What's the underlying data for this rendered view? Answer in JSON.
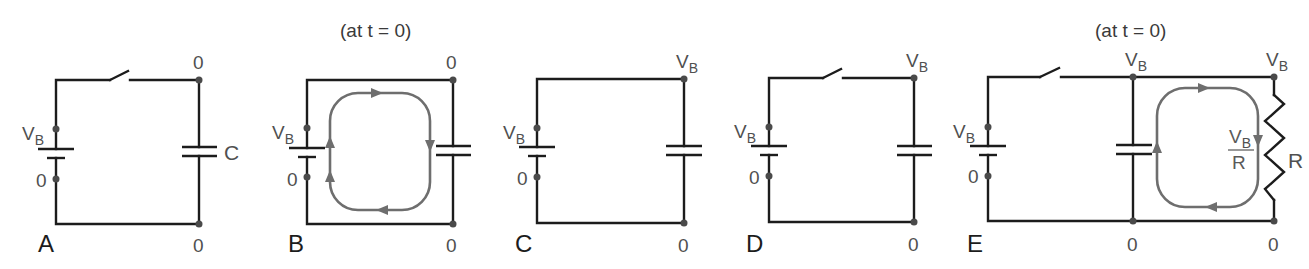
{
  "figure": {
    "colors": {
      "wire": "#1c1c1c",
      "node_dot": "#4a4a4a",
      "label": "#505050",
      "current_loop": "#6e6e6e"
    },
    "panels": [
      {
        "id": "A",
        "label": "A",
        "note": "",
        "switch": "open",
        "battery": {
          "top_label": "V",
          "top_sub": "B",
          "bottom_label": "0"
        },
        "capacitor": {
          "label": "C"
        },
        "nodes": {
          "top_right": "0",
          "top_right_sub": "",
          "bottom_right": "0"
        }
      },
      {
        "id": "B",
        "label": "B",
        "note": "(at t = 0)",
        "switch": "closed",
        "battery": {
          "top_label": "V",
          "top_sub": "B",
          "bottom_label": "0"
        },
        "capacitor": {
          "label": ""
        },
        "nodes": {
          "top_right": "0",
          "top_right_sub": "",
          "bottom_right": "0"
        },
        "current_loop": "clockwise"
      },
      {
        "id": "C",
        "label": "C",
        "note": "",
        "switch": "closed",
        "battery": {
          "top_label": "V",
          "top_sub": "B",
          "bottom_label": "0"
        },
        "capacitor": {
          "label": ""
        },
        "nodes": {
          "top_right": "V",
          "top_right_sub": "B",
          "bottom_right": "0"
        }
      },
      {
        "id": "D",
        "label": "D",
        "note": "",
        "switch": "open",
        "battery": {
          "top_label": "V",
          "top_sub": "B",
          "bottom_label": "0"
        },
        "capacitor": {
          "label": ""
        },
        "nodes": {
          "top_right": "V",
          "top_right_sub": "B",
          "bottom_right": "0"
        }
      },
      {
        "id": "E",
        "label": "E",
        "note": "(at t = 0)",
        "switch": "open",
        "battery": {
          "top_label": "V",
          "top_sub": "B",
          "bottom_label": "0"
        },
        "capacitor": {
          "label": ""
        },
        "nodes": {
          "cap_top": "V",
          "cap_top_sub": "B",
          "cap_bottom": "0",
          "res_top": "V",
          "res_top_sub": "B",
          "res_bottom": "0"
        },
        "resistor": {
          "label": "R"
        },
        "current": {
          "numerator": "V",
          "numerator_sub": "B",
          "denominator": "R"
        },
        "current_loop": "clockwise"
      }
    ]
  }
}
